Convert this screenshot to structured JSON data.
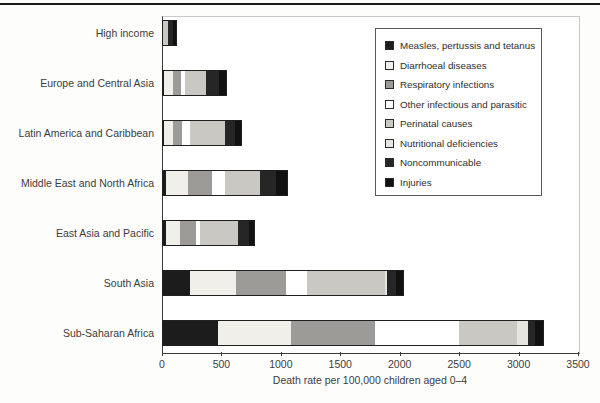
{
  "chart_data": {
    "type": "bar",
    "orientation": "horizontal",
    "stacked": true,
    "title": "",
    "xlabel": "Death rate per 100,000 children aged 0–4",
    "ylabel": "",
    "xlim": [
      0,
      3500
    ],
    "xticks": [
      0,
      500,
      1000,
      1500,
      2000,
      2500,
      3000,
      3500
    ],
    "grid": false,
    "legend_position": "top-right",
    "categories": [
      "High income",
      "Europe and Central Asia",
      "Latin America and Caribbean",
      "Middle East and North Africa",
      "East Asia and Pacific",
      "South Asia",
      "Sub-Saharan Africa"
    ],
    "series": [
      {
        "name": "Measles, pertussis and tetanus",
        "color": "#1c1c1c",
        "values": [
          0,
          10,
          10,
          25,
          25,
          225,
          460
        ]
      },
      {
        "name": "Diarrhoeal diseases",
        "color": "#f0efe9",
        "values": [
          0,
          75,
          75,
          185,
          120,
          390,
          620
        ]
      },
      {
        "name": "Respiratory infections",
        "color": "#9c9b97",
        "values": [
          0,
          70,
          75,
          205,
          130,
          420,
          700
        ]
      },
      {
        "name": "Other infectious and parasitic",
        "color": "#ffffff",
        "values": [
          0,
          30,
          70,
          105,
          40,
          180,
          710
        ]
      },
      {
        "name": "Perinatal causes",
        "color": "#c9c8c3",
        "values": [
          40,
          180,
          290,
          295,
          315,
          655,
          490
        ]
      },
      {
        "name": "Nutritional deficiencies",
        "color": "#e6e5df",
        "values": [
          0,
          0,
          0,
          0,
          0,
          15,
          90
        ]
      },
      {
        "name": "Noncommunicable",
        "color": "#262626",
        "values": [
          45,
          105,
          90,
          140,
          90,
          75,
          60
        ]
      },
      {
        "name": "Injuries",
        "color": "#111111",
        "values": [
          25,
          60,
          50,
          85,
          50,
          60,
          65
        ]
      }
    ],
    "totals": [
      110,
      530,
      660,
      1040,
      770,
      2020,
      3195
    ]
  }
}
